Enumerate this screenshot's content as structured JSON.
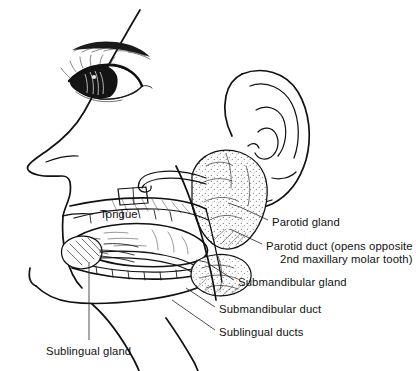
{
  "figure": {
    "background_color": "#ffffff",
    "ink_color": "#111111",
    "labels": [
      {
        "id": "tongue",
        "text": "Tongue",
        "x": 100,
        "y": 208,
        "has_leader": false
      },
      {
        "id": "parotid-gland",
        "text": "Parotid gland",
        "x": 272,
        "y": 216,
        "has_leader": true
      },
      {
        "id": "parotid-duct",
        "text_line_1": "Parotid duct (opens opposite",
        "text_line_2": "2nd maxillary molar tooth)",
        "x": 266,
        "y": 240,
        "has_leader": true
      },
      {
        "id": "submandibular-gland",
        "text": "Submandibular gland",
        "x": 238,
        "y": 276,
        "has_leader": true
      },
      {
        "id": "submandibular-duct",
        "text": "Submandibular duct",
        "x": 219,
        "y": 303,
        "has_leader": true
      },
      {
        "id": "sublingual-ducts",
        "text": "Sublingual ducts",
        "x": 219,
        "y": 326,
        "has_leader": true
      },
      {
        "id": "sublingual-gland",
        "text": "Sublingual gland",
        "x": 46,
        "y": 345,
        "has_leader": true
      }
    ]
  }
}
